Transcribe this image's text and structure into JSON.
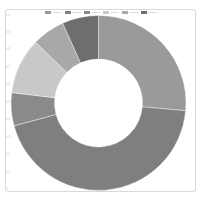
{
  "chart_data": {
    "type": "pie",
    "variant": "doughnut",
    "title": "",
    "legend_position": "top",
    "categories": [
      "Series 1",
      "Series 2",
      "Series 3",
      "Series 4",
      "Series 5",
      "Series 6"
    ],
    "values": [
      26.4,
      44.4,
      6.1,
      10.3,
      6.1,
      6.7
    ],
    "colors": [
      "#9a9a9a",
      "#7f7f7f",
      "#8a8a8a",
      "#c8c8c8",
      "#a8a8a8",
      "#6e6e6e"
    ],
    "start_angle_deg": 0,
    "direction": "clockwise",
    "cutout_ratio": 0.5,
    "y_ticks": [
      "1.0",
      "0.9",
      "0.8",
      "0.7",
      "0.6",
      "0.5",
      "0.4",
      "0.3",
      "0.2",
      "0.1",
      "0"
    ],
    "grid": false
  },
  "legend": {
    "items": [
      {
        "label": "Series 1",
        "color": "#9a9a9a"
      },
      {
        "label": "Series 2",
        "color": "#7f7f7f"
      },
      {
        "label": "Series 3",
        "color": "#8a8a8a"
      },
      {
        "label": "Series 4",
        "color": "#c8c8c8"
      },
      {
        "label": "Series 5",
        "color": "#a8a8a8"
      },
      {
        "label": "Series 6",
        "color": "#6e6e6e"
      }
    ]
  },
  "geometry": {
    "cx": 98.5,
    "cy": 103,
    "r_outer": 87.5,
    "r_inner": 44
  }
}
